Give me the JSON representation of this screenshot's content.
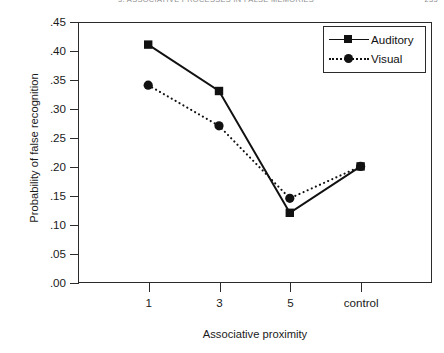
{
  "running_head": {
    "left": "3.  ASSOCIATIVE PROCESSES IN FALSE MEMORIES",
    "right": "233"
  },
  "chart_data": {
    "type": "line",
    "title": "",
    "xlabel": "Associative proximity",
    "ylabel": "Probability of false recognition",
    "categories": [
      "1",
      "3",
      "5",
      "control"
    ],
    "series": [
      {
        "name": "Auditory",
        "values": [
          0.41,
          0.33,
          0.12,
          0.2
        ],
        "marker": "square",
        "linestyle": "solid"
      },
      {
        "name": "Visual",
        "values": [
          0.34,
          0.27,
          0.145,
          0.2
        ],
        "marker": "circle",
        "linestyle": "dotted"
      }
    ],
    "ylim": [
      0.0,
      0.45
    ],
    "yticks": [
      ".45",
      ".40",
      ".35",
      ".30",
      ".25",
      ".20",
      ".15",
      ".10",
      ".05",
      ".00"
    ],
    "ytick_values": [
      0.45,
      0.4,
      0.35,
      0.3,
      0.25,
      0.2,
      0.15,
      0.1,
      0.05,
      0.0
    ],
    "grid": false,
    "legend_position": "top-right",
    "line_color": "#111111"
  }
}
